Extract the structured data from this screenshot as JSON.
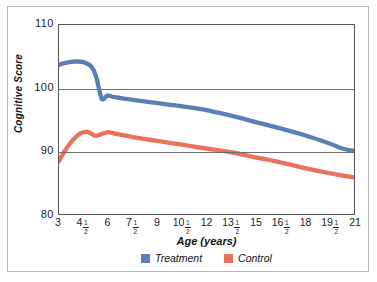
{
  "chart_data": {
    "type": "line",
    "title": "",
    "xlabel": "Age (years)",
    "ylabel": "Cognitive Score",
    "xlim": [
      3,
      21
    ],
    "ylim": [
      80,
      110
    ],
    "grid": true,
    "legend_position": "bottom-center",
    "y_ticks": [
      110,
      100,
      90,
      80
    ],
    "y_tick_labels": [
      "110",
      "100",
      "90",
      "80"
    ],
    "x_ticks": [
      3,
      4.5,
      6,
      7.5,
      9,
      10.5,
      12,
      13.5,
      15,
      16.5,
      18,
      19.5,
      21
    ],
    "x_tick_labels": [
      {
        "whole": "3",
        "num": "",
        "den": ""
      },
      {
        "whole": "4",
        "num": "1",
        "den": "2"
      },
      {
        "whole": "6",
        "num": "",
        "den": ""
      },
      {
        "whole": "7",
        "num": "1",
        "den": "2"
      },
      {
        "whole": "9",
        "num": "",
        "den": ""
      },
      {
        "whole": "10",
        "num": "1",
        "den": "2"
      },
      {
        "whole": "12",
        "num": "",
        "den": ""
      },
      {
        "whole": "13",
        "num": "1",
        "den": "2"
      },
      {
        "whole": "15",
        "num": "",
        "den": ""
      },
      {
        "whole": "16",
        "num": "1",
        "den": "2"
      },
      {
        "whole": "18",
        "num": "",
        "den": ""
      },
      {
        "whole": "19",
        "num": "1",
        "den": "2"
      },
      {
        "whole": "21",
        "num": "",
        "den": ""
      }
    ],
    "series": [
      {
        "name": "Treatment",
        "color": "#5B7FB5",
        "x": [
          3.0,
          3.4,
          4.0,
          4.5,
          5.0,
          5.3,
          5.6,
          5.9,
          6.0,
          6.5,
          7.5,
          9.0,
          10.5,
          12.0,
          13.5,
          15.0,
          16.5,
          18.0,
          19.5,
          20.3,
          21.0
        ],
        "values": [
          103.7,
          104.0,
          104.2,
          104.1,
          103.3,
          101.5,
          98.3,
          98.7,
          98.8,
          98.5,
          98.1,
          97.6,
          97.1,
          96.5,
          95.6,
          94.6,
          93.6,
          92.5,
          91.2,
          90.4,
          90.0
        ]
      },
      {
        "name": "Control",
        "color": "#E8735A",
        "x": [
          3.0,
          3.3,
          3.8,
          4.3,
          4.8,
          5.2,
          5.5,
          6.0,
          6.5,
          7.5,
          9.0,
          10.5,
          12.0,
          13.5,
          15.0,
          16.5,
          18.0,
          19.5,
          21.0
        ],
        "values": [
          88.4,
          89.8,
          91.6,
          92.8,
          93.0,
          92.4,
          92.6,
          93.0,
          92.7,
          92.2,
          91.6,
          91.0,
          90.4,
          89.8,
          89.0,
          88.2,
          87.3,
          86.5,
          85.8
        ]
      }
    ]
  },
  "legend": {
    "items": [
      {
        "label": "Treatment",
        "color": "#5B7FB5"
      },
      {
        "label": "Control",
        "color": "#E8735A"
      }
    ]
  },
  "axes": {
    "y_title": "Cognitive Score",
    "x_title": "Age (years)"
  }
}
